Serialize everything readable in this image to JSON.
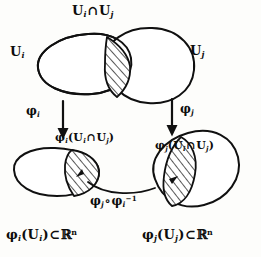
{
  "figure": {
    "style": "hand-drawn ink on paper",
    "ink_color": "#0d0d0d",
    "paper_color": "#fdfdfb"
  },
  "labels": {
    "top_intersection": {
      "text": "Uᵢ ∩ Uⱼ",
      "base_left": "U",
      "sub_left": "i",
      "operator": "∩",
      "base_right": "U",
      "sub_right": "j"
    },
    "set_ui": {
      "base": "U",
      "sub": "i"
    },
    "set_uj": {
      "base": "U",
      "sub": "j"
    },
    "map_phi_i": {
      "base": "φ",
      "sub": "i"
    },
    "map_phi_j": {
      "base": "φ",
      "sub": "j"
    },
    "phi_i_image": {
      "base": "φ",
      "sub": "i",
      "open": "(",
      "arg_left": "U",
      "arg_left_sub": "i",
      "operator": "∩",
      "arg_right": "U",
      "arg_right_sub": "j",
      "close": ")"
    },
    "phi_j_image": {
      "base": "φ",
      "sub": "j",
      "open": "(",
      "arg_left": "U",
      "arg_left_sub": "i",
      "operator": "∩",
      "arg_right": "U",
      "arg_right_sub": "j",
      "close": ")"
    },
    "transition_map": {
      "first_base": "φ",
      "first_sub": "j",
      "compose": "∘",
      "second_base": "φ",
      "second_sub": "i",
      "second_sup": "−1"
    },
    "bottom_left": {
      "base": "φ",
      "sub": "i",
      "open": "(",
      "arg": "U",
      "arg_sub": "i",
      "close": ")",
      "relation": "⊂",
      "target": "ℝ",
      "target_sup": "n"
    },
    "bottom_right": {
      "base": "φ",
      "sub": "j",
      "open": "(",
      "arg": "U",
      "arg_sub": "j",
      "close": ")",
      "relation": "⊂",
      "target": "ℝ",
      "target_sup": "n"
    }
  },
  "shapes": {
    "upper_left_blob": "open set U_i drawn as a hand-drawn oval",
    "upper_right_blob": "open set U_j drawn as a hand-drawn oval",
    "upper_overlap": "hatched lens-shaped intersection U_i ∩ U_j",
    "lower_left_blob": "image phi_i(U_i) drawn as an oval in R^n",
    "lower_left_hatch": "hatched region phi_i(U_i ∩ U_j)",
    "lower_right_blob": "image phi_j(U_j) drawn as a tilted oval in R^n",
    "lower_right_hatch": "hatched region phi_j(U_i ∩ U_j)",
    "arrow_left": "downward arrow labelled phi_i",
    "arrow_right": "downward arrow labelled phi_j",
    "transition_arrow": "curved arrow between the two hatched regions"
  }
}
